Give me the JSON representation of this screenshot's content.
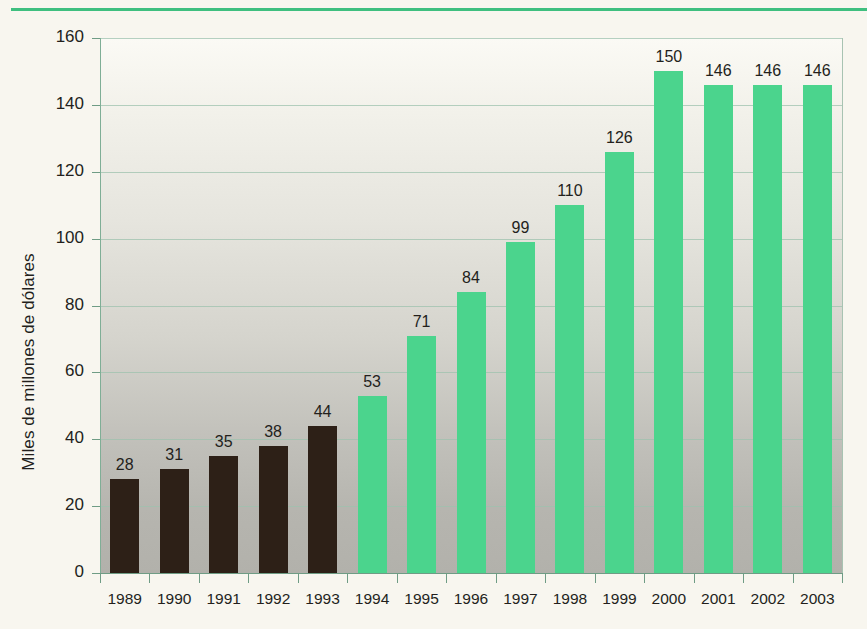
{
  "chart_data": {
    "type": "bar",
    "title": "",
    "xlabel": "",
    "ylabel": "Miles de millones de dólares",
    "categories": [
      "1989",
      "1990",
      "1991",
      "1992",
      "1993",
      "1994",
      "1995",
      "1996",
      "1997",
      "1998",
      "1999",
      "2000",
      "2001",
      "2002",
      "2003"
    ],
    "values": [
      28,
      31,
      35,
      38,
      44,
      53,
      71,
      84,
      99,
      110,
      126,
      150,
      146,
      146,
      146
    ],
    "value_labels": [
      "28",
      "31",
      "35",
      "38",
      "44",
      "53",
      "71",
      "84",
      "99",
      "110",
      "126",
      "150",
      "146",
      "146",
      "146"
    ],
    "bar_colors": [
      "#2d2017",
      "#2d2017",
      "#2d2017",
      "#2d2017",
      "#2d2017",
      "#4bd48d",
      "#4bd48d",
      "#4bd48d",
      "#4bd48d",
      "#4bd48d",
      "#4bd48d",
      "#4bd48d",
      "#4bd48d",
      "#4bd48d",
      "#4bd48d"
    ],
    "ylim": [
      0,
      160
    ],
    "yticks": [
      0,
      20,
      40,
      60,
      80,
      100,
      120,
      140,
      160
    ],
    "ytick_labels": [
      "0",
      "20",
      "40",
      "60",
      "80",
      "100",
      "120",
      "140",
      "160"
    ],
    "grid": true,
    "legend": "none",
    "colors": {
      "bar_dark": "#2d2017",
      "bar_green": "#4bd48d",
      "rule_green": "#3fbf7f",
      "gridline": "#9ec2ad",
      "page_background": "#f8f6ef",
      "plot_top": "#fbfaf5",
      "plot_bottom": "#b2b1ab",
      "text": "#231f1c"
    }
  }
}
